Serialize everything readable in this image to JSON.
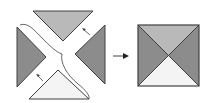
{
  "diagram": {
    "colors": {
      "top": "#b9b9b9",
      "left": "#8c8c8c",
      "right": "#8c8c8c",
      "bottom": "#f4f4f4",
      "stroke": "#404040",
      "background": "#ffffff"
    },
    "left_group": {
      "pieces": [
        "top-triangle",
        "left-triangle",
        "right-triangle",
        "bottom-triangle"
      ],
      "small_arrows": 2,
      "cut_line": true
    },
    "transition_arrow": "right-arrow",
    "result": {
      "shape": "square",
      "quadrants": [
        "top",
        "left",
        "right",
        "bottom"
      ]
    }
  }
}
